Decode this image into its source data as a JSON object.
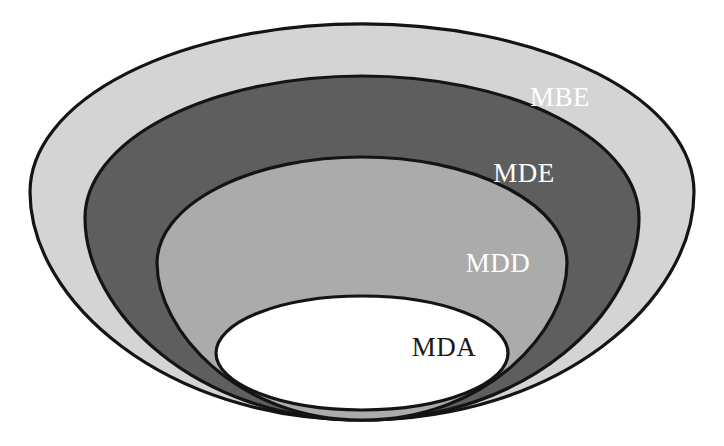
{
  "figure": {
    "type": "nested-onion-funnel-diagram",
    "title": "",
    "background_color": "#ffffff",
    "outline_color": "#141414",
    "canvas": {
      "width": 724,
      "height": 446
    },
    "apex": {
      "x": 362,
      "y": 420
    }
  },
  "layers": [
    {
      "id": "mbe",
      "label": "MBE",
      "fill": "#d4d4d4",
      "stroke": "#141414",
      "text_color": "#ffffff",
      "order": 1,
      "ellipse": {
        "cx": 362,
        "cy": 192,
        "rx": 332,
        "ry": 168
      },
      "label_pos": {
        "x": 560,
        "y": 97
      }
    },
    {
      "id": "mde",
      "label": "MDE",
      "fill": "#5e5e5e",
      "stroke": "#141414",
      "text_color": "#ffffff",
      "order": 2,
      "ellipse": {
        "cx": 362,
        "cy": 218,
        "rx": 277,
        "ry": 142
      },
      "label_pos": {
        "x": 524,
        "y": 173
      }
    },
    {
      "id": "mdd",
      "label": "MDD",
      "fill": "#ababab",
      "stroke": "#141414",
      "text_color": "#ffffff",
      "order": 3,
      "ellipse": {
        "cx": 362,
        "cy": 263,
        "rx": 205,
        "ry": 106
      },
      "label_pos": {
        "x": 498,
        "y": 263
      }
    },
    {
      "id": "mda",
      "label": "MDA",
      "fill": "#ffffff",
      "stroke": "#141414",
      "text_color": "#1a1a1a",
      "order": 4,
      "ellipse": {
        "cx": 362,
        "cy": 353,
        "rx": 146,
        "ry": 57
      },
      "label_pos": {
        "x": 444,
        "y": 347
      }
    }
  ]
}
